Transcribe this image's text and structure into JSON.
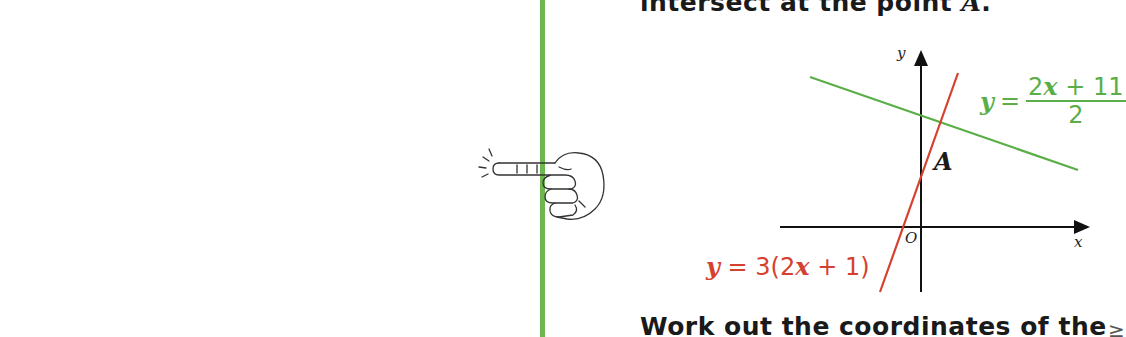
{
  "intro": {
    "text_before": "intersect at the point ",
    "point_var": "A",
    "text_after": "."
  },
  "graph": {
    "y_axis_label": "y",
    "x_axis_label": "x",
    "origin_label": "O",
    "point_label": "A",
    "lines": [
      {
        "name": "green-line",
        "color": "#5aae47",
        "equation_lhs": "y",
        "equation_eq": "=",
        "numerator_pre": "2",
        "numerator_var": "x",
        "numerator_post": " + 11",
        "denominator": "2"
      },
      {
        "name": "red-line",
        "color": "#d6402e",
        "equation_lhs": "y",
        "equation_mid": " = 3(2",
        "equation_var": "x",
        "equation_post": " + 1)"
      }
    ]
  },
  "question": {
    "text": "Work out the coordinates of the"
  },
  "decor": {
    "rule_color": "#6cb84e",
    "hand_icon": "pointing-hand-icon",
    "cut_glyph": "≥"
  }
}
